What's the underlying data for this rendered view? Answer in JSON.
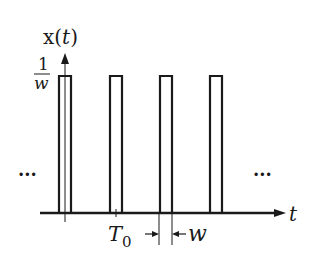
{
  "figure": {
    "y_axis_label_prefix": "x(",
    "y_axis_label_var": "t",
    "y_axis_label_suffix": ")",
    "amplitude_numerator": "1",
    "amplitude_denominator": "w",
    "x_axis_label": "t",
    "period_label_main": "T",
    "period_label_sub": "0",
    "width_label": "w",
    "ellipsis_left": "···",
    "ellipsis_right": "···",
    "colors": {
      "line": "#1a1a1a",
      "background": "#ffffff"
    }
  }
}
